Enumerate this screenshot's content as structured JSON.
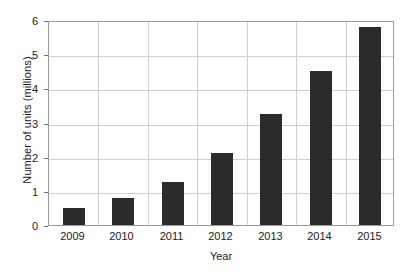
{
  "chart_data": {
    "type": "bar",
    "title": "",
    "categories": [
      "2009",
      "2010",
      "2011",
      "2012",
      "2013",
      "2014",
      "2015"
    ],
    "values": [
      0.5,
      0.8,
      1.25,
      2.1,
      3.25,
      4.5,
      5.8
    ],
    "xlabel": "Year",
    "ylabel": "Number of units (millions)",
    "ylim": [
      0,
      6
    ],
    "yticks": [
      "0",
      "1",
      "2",
      "3",
      "4",
      "5",
      "6"
    ],
    "ytick_values": [
      0,
      1,
      2,
      3,
      4,
      5,
      6
    ],
    "grid": "both",
    "legend": "none",
    "series": [
      {
        "name": "Number of units",
        "values": [
          0.5,
          0.8,
          1.25,
          2.1,
          3.25,
          4.5,
          5.8
        ]
      }
    ],
    "colors": {
      "bar": "#2b2b2b",
      "grid": "#cfcfcf",
      "frame": "#9a9a9a",
      "background": "#ffffff",
      "text": "#1a1a1a"
    }
  }
}
